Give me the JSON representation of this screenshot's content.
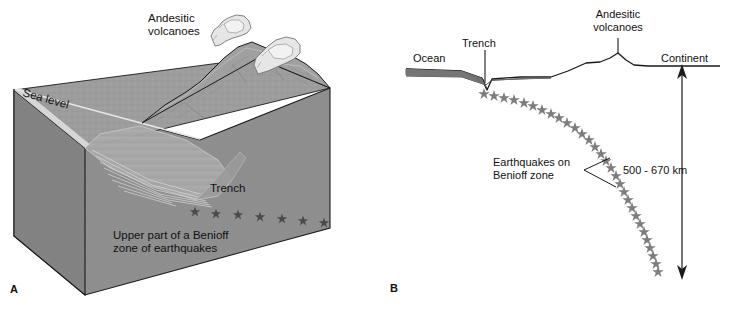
{
  "figure": {
    "title_hidden": "",
    "background_color": "#ffffff",
    "ink_color": "#111111"
  },
  "panel_a": {
    "letter": "A",
    "type": "block-diagram",
    "description": "Three-dimensional cutaway block diagram of an ocean-continent convergent margin",
    "labels": {
      "sea_level": "Sea level",
      "andesitic_volcanoes": "Andesitic\nvolcanoes",
      "andesitic_volcanoes_line1": "Andesitic",
      "andesitic_volcanoes_line2": "volcanoes",
      "trench": "Trench",
      "benioff_line1": "Upper part of a Benioff",
      "benioff_line2": "zone of earthquakes"
    },
    "colors": {
      "block_top": "#9a9a9a",
      "block_front": "#8e8e8e",
      "block_side": "#848484",
      "terrain_light": "#b4b4b4",
      "terrain_shadow": "#777777",
      "plume": "#e3e3e3",
      "star": "#4a4a4a",
      "outline": "#1a1a1a"
    },
    "earthquake_stars": 8,
    "volcano_plumes": 2
  },
  "panel_b": {
    "letter": "B",
    "type": "cross-section",
    "description": "Two-dimensional cross-section of subduction zone showing dipping Benioff zone of earthquakes",
    "labels": {
      "ocean": "Ocean",
      "trench": "Trench",
      "andesitic_volcanoes_line1": "Andesitic",
      "andesitic_volcanoes_line2": "volcanoes",
      "continent": "Continent",
      "earthquakes_line1": "Earthquakes on",
      "earthquakes_line2": "Benioff zone",
      "depth": "500 - 670 km"
    },
    "colors": {
      "ocean_fill": "#7d7d7d",
      "star": "#7d7d7d",
      "line": "#1a1a1a"
    },
    "earthquake_stars": 36,
    "depth_range_km": [
      500,
      670
    ]
  }
}
